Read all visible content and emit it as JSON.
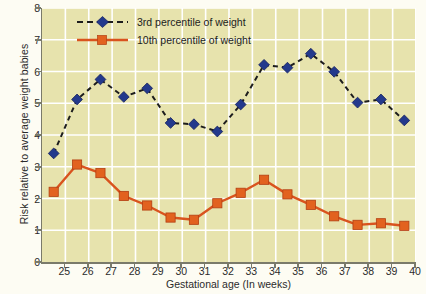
{
  "chart_data": {
    "type": "line",
    "title": "",
    "xlabel": "Gestational age (In weeks)",
    "ylabel": "Risk relative to average weight babies",
    "xlim": [
      24,
      40
    ],
    "ylim": [
      0,
      8
    ],
    "xticks": [
      25,
      26,
      27,
      28,
      29,
      30,
      31,
      32,
      33,
      34,
      35,
      36,
      37,
      38,
      39,
      40
    ],
    "yticks": [
      0,
      1,
      2,
      3,
      4,
      5,
      6,
      7,
      8
    ],
    "grid": true,
    "legend_position": "top-left",
    "x": [
      24.5,
      25.5,
      26.5,
      27.5,
      28.5,
      29.5,
      30.5,
      31.5,
      32.5,
      33.5,
      34.5,
      35.5,
      36.5,
      37.5,
      38.5,
      39.5
    ],
    "series": [
      {
        "name": "3rd percentile of weight",
        "color": "#23398c",
        "marker": "diamond",
        "linestyle": "dashed",
        "values": [
          3.42,
          5.12,
          5.75,
          5.2,
          5.47,
          4.38,
          4.34,
          4.11,
          4.96,
          6.21,
          6.12,
          6.56,
          5.99,
          5.02,
          5.12,
          4.46
        ]
      },
      {
        "name": "10th percentile of weight",
        "color": "#d9531e",
        "marker": "square",
        "linestyle": "solid",
        "values": [
          2.21,
          3.07,
          2.8,
          2.08,
          1.78,
          1.4,
          1.33,
          1.85,
          2.18,
          2.59,
          2.13,
          1.8,
          1.44,
          1.17,
          1.22,
          1.14
        ]
      }
    ]
  },
  "legend": {
    "items": [
      {
        "label": "3rd percentile of weight"
      },
      {
        "label": "10th percentile of weight"
      }
    ]
  },
  "colors": {
    "plot_background": "#e7e3ad",
    "page_background": "#fdfcf3",
    "gridline": "#ffffff",
    "axis": "#7a7a6a",
    "series_blue": "#23398c",
    "series_orange": "#d9531e"
  }
}
